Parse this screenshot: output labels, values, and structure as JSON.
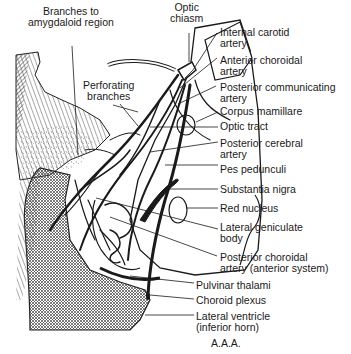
{
  "figure": {
    "credit": "A.A.A.",
    "labels": {
      "branches_amygdaloid": "Branches to\namygdaloid region",
      "optic_chiasm": "Optic\nchiasm",
      "perforating_branches": "Perforating\nbranches",
      "internal_carotid": "Internal carotid\nartery",
      "anterior_choroidal": "Anterior choroidal\nartery",
      "posterior_communicating": "Posterior communicating\nartery",
      "corpus_mamillare": "Corpus mamillare",
      "optic_tract": "Optic tract",
      "posterior_cerebral": "Posterior cerebral\nartery",
      "pes_pedunculi": "Pes pedunculi",
      "substantia_nigra": "Substantia nigra",
      "red_nucleus": "Red nucleus",
      "lateral_geniculate": "Lateral geniculate\nbody",
      "posterior_choroidal": "Posterior choroidal\nartery (anterior system)",
      "pulvinar_thalami": "Pulvinar thalami",
      "choroid_plexus": "Choroid plexus",
      "lateral_ventricle": "Lateral ventricle\n(inferior horn)"
    },
    "colors": {
      "ink": "#1a1a1a",
      "background": "#ffffff",
      "hatch": "#555555"
    }
  }
}
